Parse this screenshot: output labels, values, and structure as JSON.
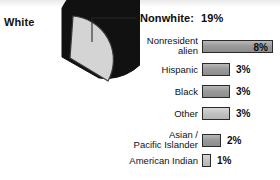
{
  "chart_data": {
    "type": "pie",
    "title": "",
    "pie": {
      "categories": [
        "White",
        "Nonwhite"
      ],
      "values": [
        81,
        19
      ],
      "labels": [
        "81%",
        "19%"
      ],
      "colors": [
        "#111111",
        "#d4d4d4"
      ],
      "exploded_slice": "Nonwhite"
    },
    "callout": {
      "label": "Nonwhite:",
      "value": "19%"
    },
    "bar": {
      "type": "bar",
      "orientation": "horizontal",
      "categories": [
        "Nonresident\nalien",
        "Hispanic",
        "Black",
        "Other",
        "Asian /\nPacific Islander",
        "American Indian"
      ],
      "values": [
        8,
        3,
        3,
        3,
        2,
        1
      ],
      "value_labels": [
        "8%",
        "3%",
        "3%",
        "3%",
        "2%",
        "1%"
      ],
      "xlim": [
        0,
        8
      ],
      "grid": false
    },
    "pie_white_label": "White",
    "pie_white_value": "81%"
  },
  "pie": {
    "white_label": "White",
    "white_value": "81%"
  },
  "callout": {
    "label": "Nonwhite:",
    "value": "19%"
  },
  "bars": [
    {
      "label": "Nonresident\nalien",
      "value": "8%",
      "width": 71,
      "inside": true,
      "light": false
    },
    {
      "label": "Hispanic",
      "value": "3%",
      "width": 28,
      "inside": false,
      "light": false
    },
    {
      "label": "Black",
      "value": "3%",
      "width": 28,
      "inside": false,
      "light": false
    },
    {
      "label": "Other",
      "value": "3%",
      "width": 28,
      "inside": false,
      "light": true
    },
    {
      "label": "Asian /\nPacific Islander",
      "value": "2%",
      "width": 19,
      "inside": false,
      "light": false
    },
    {
      "label": "American Indian",
      "value": "1%",
      "width": 9,
      "inside": false,
      "light": true
    }
  ]
}
